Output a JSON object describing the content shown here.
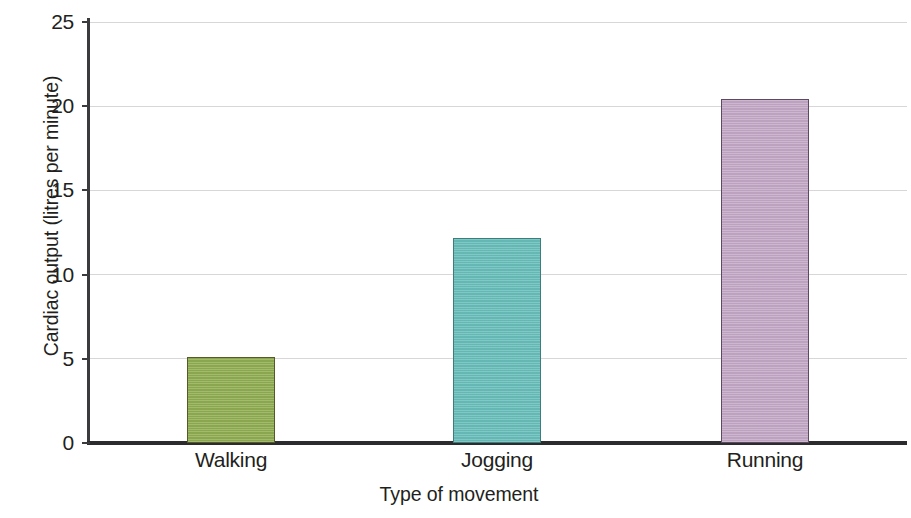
{
  "chart_data": {
    "type": "bar",
    "title": "",
    "xlabel": "Type of movement",
    "ylabel": "Cardiac output (litres per minute)",
    "categories": [
      "Walking",
      "Jogging",
      "Running"
    ],
    "values": [
      5.1,
      12.2,
      20.4
    ],
    "series": [
      {
        "name": "Cardiac output",
        "values": [
          5.1,
          12.2,
          20.4
        ]
      }
    ],
    "bar_colors": [
      "#8fad52",
      "#68beba",
      "#c4a8c6"
    ],
    "bar_edge_colors": [
      "#555a28",
      "#3f7d7c",
      "#5e4a60"
    ],
    "ylim": [
      0,
      25
    ],
    "ytick_labels": [
      "0",
      "5",
      "10",
      "15",
      "20",
      "25"
    ],
    "ytick_values": [
      0,
      5,
      10,
      15,
      20,
      25
    ],
    "grid": true,
    "grid_color": "#d8d6d8",
    "legend": "none",
    "axis_color": "#2c2b2d",
    "background": "#ffffff"
  }
}
